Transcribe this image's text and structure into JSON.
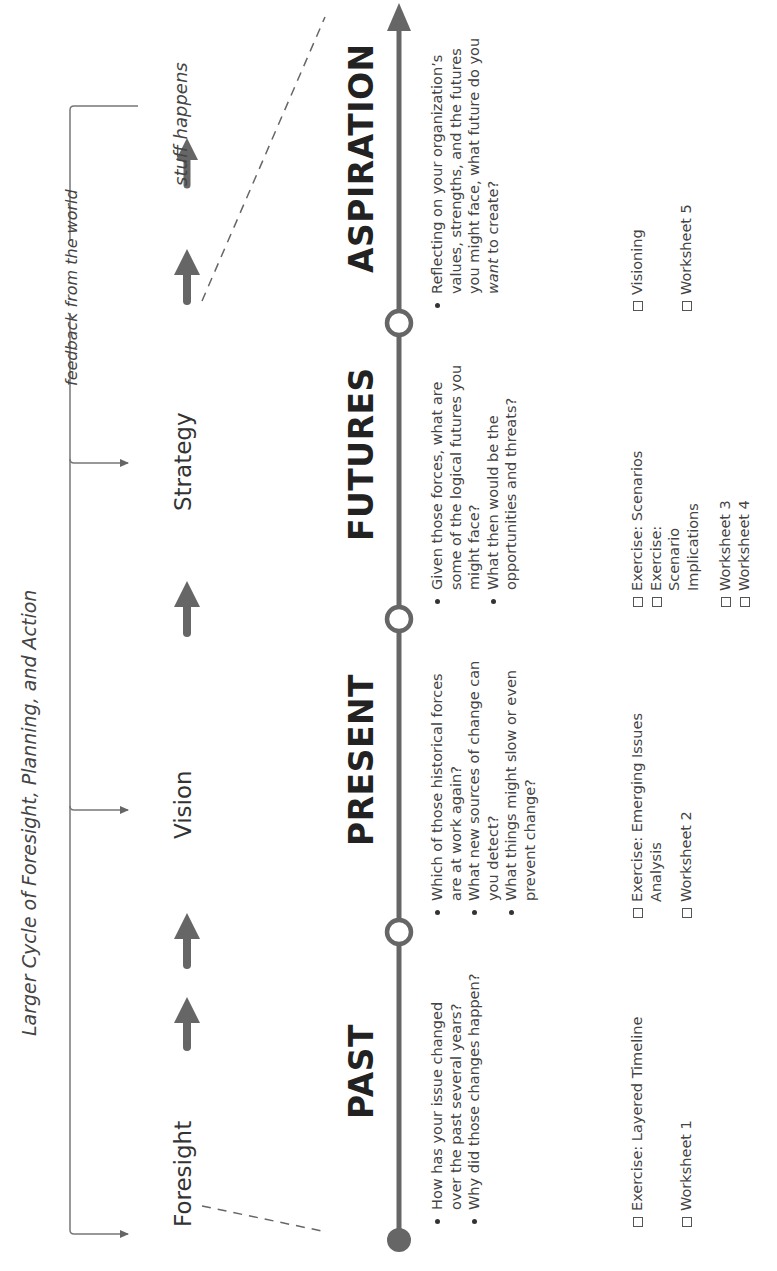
{
  "larger_cycle": {
    "title": "Larger Cycle of Foresight, Planning, and Action",
    "stages": [
      "Foresight",
      "Vision",
      "Strategy"
    ],
    "feedback_label": "feedback from the world",
    "outcome_label": "stuff happens"
  },
  "timeline": {
    "phases": [
      {
        "name": "PAST",
        "questions": [
          "How has your issue changed over the past several years?",
          "Why did those changes happen?"
        ],
        "exercises": [
          "Exercise: Layered Timeline"
        ],
        "worksheets": [
          "Worksheet 1"
        ]
      },
      {
        "name": "PRESENT",
        "questions": [
          "Which of those historical forces are at work again?",
          "What new sources of change can you detect?",
          "What things might slow or even prevent change?"
        ],
        "exercises": [
          "Exercise: Emerging Issues Analysis"
        ],
        "worksheets": [
          "Worksheet 2"
        ]
      },
      {
        "name": "FUTURES",
        "questions": [
          "Given those forces, what are some of the logical futures you might face?",
          "What then would be the opportunities and threats?"
        ],
        "exercises": [
          "Exercise: Scenarios",
          "Exercise: Scenario Implications"
        ],
        "worksheets": [
          "Worksheet 3",
          "Worksheet 4"
        ]
      },
      {
        "name": "ASPIRATION",
        "questions_parts": {
          "before": "Reflecting on your organization’s values, strengths, and the futures you might face, what future do you ",
          "emphasis": "want",
          "after": " to create?"
        },
        "exercises": [
          "Visioning"
        ],
        "worksheets": [
          "Worksheet 5"
        ]
      }
    ]
  },
  "colors": {
    "line": "#666666",
    "text": "#333333",
    "background": "#ffffff"
  }
}
